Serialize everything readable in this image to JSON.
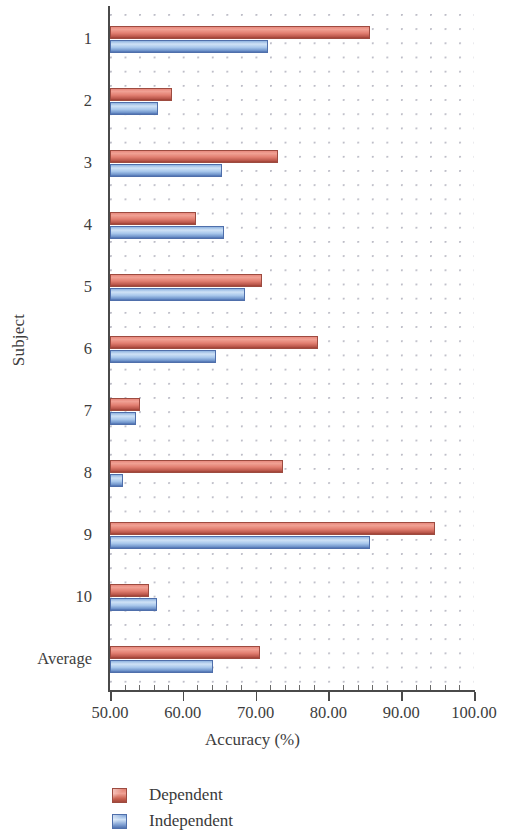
{
  "chart_data": {
    "type": "bar",
    "orientation": "horizontal",
    "title": "",
    "xlabel": "Accuracy (%)",
    "ylabel": "Subject",
    "categories": [
      "1",
      "2",
      "3",
      "4",
      "5",
      "6",
      "7",
      "8",
      "9",
      "10",
      "Average"
    ],
    "series": [
      {
        "name": "Dependent",
        "color": "#e0836f",
        "values": [
          85.7,
          58.5,
          73.1,
          61.8,
          70.9,
          78.6,
          54.1,
          73.8,
          94.6,
          55.4,
          70.6
        ]
      },
      {
        "name": "Independent",
        "color": "#a5c6ec",
        "values": [
          71.7,
          56.6,
          65.4,
          65.7,
          68.5,
          64.6,
          53.6,
          51.8,
          85.7,
          56.5,
          64.1
        ]
      }
    ],
    "xlim": [
      50,
      100
    ],
    "ylim_categories": 11,
    "x_tick_labels": [
      "50.00",
      "60.00",
      "70.00",
      "80.00",
      "90.00",
      "100.00"
    ],
    "x_tick_values": [
      50,
      60,
      70,
      80,
      90,
      100
    ],
    "x_minor_tick_step": 2,
    "grid": "dotted",
    "legend_position": "below-axes-left"
  },
  "axes": {
    "y_title": "Subject",
    "x_title": "Accuracy (%)",
    "y_tick_labels": [
      "1",
      "2",
      "3",
      "4",
      "5",
      "6",
      "7",
      "8",
      "9",
      "10",
      "Average"
    ],
    "x_tick_labels": [
      "50.00",
      "60.00",
      "70.00",
      "80.00",
      "90.00",
      "100.00"
    ]
  },
  "legend": {
    "items": [
      {
        "label": "Dependent",
        "swatch": "dependent-swatch"
      },
      {
        "label": "Independent",
        "swatch": "independent-swatch"
      }
    ]
  }
}
